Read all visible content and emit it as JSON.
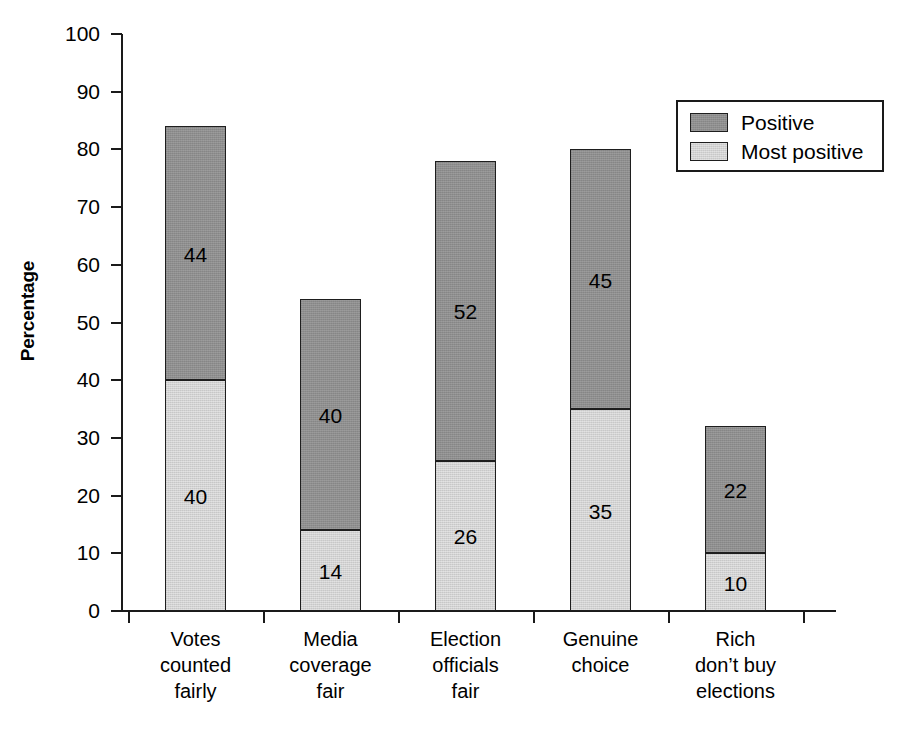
{
  "chart_data": {
    "type": "bar",
    "subtype": "stacked-vertical",
    "title": "",
    "xlabel": "",
    "ylabel": "Percentage",
    "ylim": [
      0,
      100
    ],
    "ytick_step": 10,
    "yticks": [
      100,
      90,
      80,
      70,
      60,
      50,
      40,
      30,
      20,
      10,
      0
    ],
    "grid": false,
    "legend_position": "top-right",
    "categories": [
      "Votes counted fairly",
      "Media coverage fair",
      "Election officials fair",
      "Genuine choice",
      "Rich don’t buy elections"
    ],
    "category_label_lines": [
      [
        "Votes",
        "counted",
        "fairly"
      ],
      [
        "Media",
        "coverage",
        "fair"
      ],
      [
        "Election",
        "officials",
        "fair"
      ],
      [
        "Genuine",
        "choice"
      ],
      [
        "Rich",
        "don’t buy",
        "elections"
      ]
    ],
    "series": [
      {
        "name": "Most positive",
        "color": "#d2d2d2",
        "stack_order": 0,
        "values": [
          40,
          14,
          26,
          35,
          10
        ]
      },
      {
        "name": "Positive",
        "color": "#8e8e8e",
        "stack_order": 1,
        "values": [
          44,
          40,
          52,
          45,
          22
        ]
      }
    ],
    "totals": [
      84,
      54,
      78,
      80,
      32
    ],
    "value_labels_shown": true
  },
  "legend": {
    "items": [
      {
        "label": "Positive",
        "color": "#8e8e8e"
      },
      {
        "label": "Most positive",
        "color": "#d2d2d2"
      }
    ]
  },
  "axis": {
    "y_title": "Percentage"
  }
}
